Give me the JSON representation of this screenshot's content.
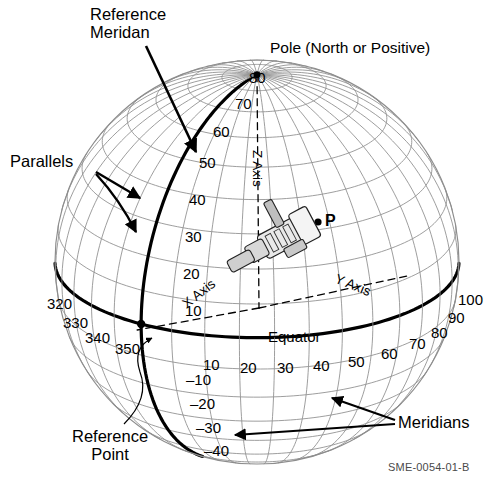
{
  "figure": {
    "caption_id": "SME-0054-01-B"
  },
  "callouts": {
    "reference_meridian": "Reference\nMeridan",
    "parallels": "Parallels",
    "meridians": "Meridians",
    "reference_point": "Reference\nPoint",
    "pole": "Pole (North or Positive)",
    "equator": "Equator",
    "point_p": "P"
  },
  "axes": {
    "z": "Z Axis",
    "x": "X Axis",
    "y": "Y Axis"
  },
  "chart_data": {
    "type": "scatter",
    "projection": "orthographic globe",
    "latitude_ticks_north": [
      10,
      20,
      30,
      40,
      50,
      60,
      70,
      80
    ],
    "latitude_ticks_south": [
      -10,
      -20,
      -30,
      -40
    ],
    "longitude_ticks_east": [
      10,
      20,
      30,
      40,
      50,
      60,
      70,
      80,
      90,
      100
    ],
    "longitude_ticks_west": [
      320,
      330,
      340,
      350
    ],
    "grid_spacing_deg": 10,
    "annotations": [
      "Reference Meridan",
      "Parallels",
      "Meridians",
      "Reference Point",
      "Pole (North or Positive)",
      "Equator",
      "Z Axis",
      "X Axis",
      "Y Axis",
      "P"
    ]
  },
  "tick_labels": {
    "lat_80": "80",
    "lat_70": "70",
    "lat_60": "60",
    "lat_50": "50",
    "lat_40": "40",
    "lat_30": "30",
    "lat_20": "20",
    "lat_10": "10",
    "lat_m10": "–10",
    "lat_m20": "–20",
    "lat_m30": "–30",
    "lat_m40": "–40",
    "lon_10": "10",
    "lon_20": "20",
    "lon_30": "30",
    "lon_40": "40",
    "lon_50": "50",
    "lon_60": "60",
    "lon_70": "70",
    "lon_80": "80",
    "lon_90": "90",
    "lon_100": "100",
    "lon_320": "320",
    "lon_330": "330",
    "lon_340": "340",
    "lon_350": "350"
  },
  "colors": {
    "grid": "#8d8d8d",
    "heavy": "#000000",
    "text": "#000000",
    "caption": "#4a4a4a",
    "background": "#ffffff"
  }
}
